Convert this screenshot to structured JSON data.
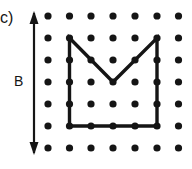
{
  "figure": {
    "part_label": "c)",
    "dimension_label": "B",
    "caption_hidden": "",
    "background_color": "#ffffff",
    "ink_color": "#151515"
  },
  "grid": {
    "name": "geoboard-dot-grid",
    "columns": 7,
    "rows": 7,
    "dot_radius": 3.6,
    "dot_color": "#151515",
    "x_positions": [
      48,
      69.5,
      91,
      113,
      135,
      157,
      178.5
    ],
    "y_positions": [
      16,
      38,
      60,
      82,
      104,
      126,
      148
    ]
  },
  "shape": {
    "name": "rubber-band-polygon",
    "type": "polygon",
    "stroke_color": "#151515",
    "stroke_width": 3.4,
    "fill": "none",
    "vertices_grid": [
      {
        "col": 1,
        "row": 1
      },
      {
        "col": 3,
        "row": 3
      },
      {
        "col": 5,
        "row": 1
      },
      {
        "col": 5,
        "row": 5
      },
      {
        "col": 1,
        "row": 5
      }
    ],
    "points": "69.5,38 113,82 157,38 157,126 69.5,126",
    "vertex_count": 5
  },
  "dimension_arrow": {
    "name": "height-dimension-arrow",
    "orientation": "vertical",
    "double_headed": true,
    "x": 34,
    "y_top": 11,
    "y_bottom": 155,
    "stroke_color": "#151515",
    "stroke_width": 2.2,
    "head_width": 9,
    "head_length": 13,
    "label": "B"
  },
  "chart_data": {
    "type": "scatter",
    "title": "",
    "xlabel": "",
    "ylabel": "",
    "grid": true,
    "legend": "none",
    "categories": [],
    "values": [],
    "annotations": [
      "c)",
      "B"
    ]
  }
}
